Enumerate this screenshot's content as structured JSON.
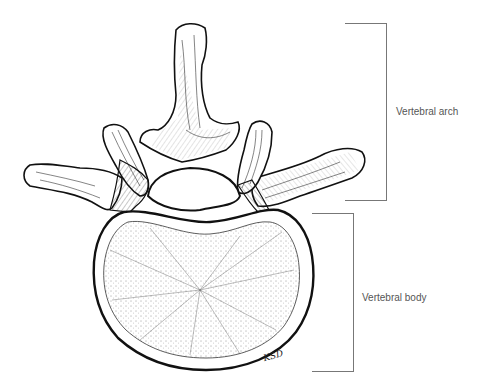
{
  "figure": {
    "labels": [
      {
        "id": "arch",
        "text": "Vertebral arch"
      },
      {
        "id": "body",
        "text": "Vertebral body"
      }
    ],
    "signature": "KSD",
    "caption": "Figure 1.1 The lumbar vertebra"
  },
  "colors": {
    "ink": "#111111",
    "bracket": "#777777",
    "label": "#555555",
    "background": "#ffffff"
  }
}
